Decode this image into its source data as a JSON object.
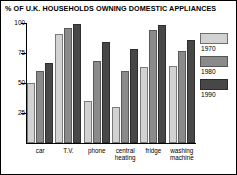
{
  "chart_data": {
    "type": "bar",
    "title": "% OF U.K. HOUSEHOLDS OWNING DOMESTIC APPLIANCES",
    "xlabel": "",
    "ylabel": "",
    "ylim": [
      0,
      100
    ],
    "yticks": [
      100,
      75,
      50,
      25
    ],
    "grid": false,
    "legend_position": "right",
    "categories": [
      "car",
      "T.V.",
      "phone",
      "central\nheating",
      "fridge",
      "washing\nmachine"
    ],
    "series": [
      {
        "name": "1970",
        "color": "#d2d2d2",
        "values": [
          50,
          91,
          35,
          30,
          63,
          64
        ]
      },
      {
        "name": "1980",
        "color": "#8a8a8a",
        "values": [
          60,
          96,
          68,
          60,
          94,
          77
        ]
      },
      {
        "name": "1990",
        "color": "#474747",
        "values": [
          67,
          99,
          84,
          78,
          98,
          86
        ]
      }
    ]
  }
}
